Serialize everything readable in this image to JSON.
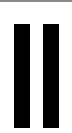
{
  "control": {
    "icon": "pause-icon",
    "label": "Pause",
    "color": "#000000",
    "background": "#ffffff",
    "border_color": "#8a8a8a"
  }
}
